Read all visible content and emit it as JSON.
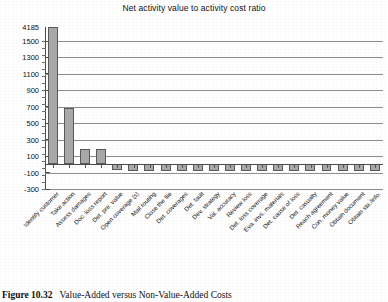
{
  "chart_data": {
    "type": "bar",
    "title": "Net activity value to activity cost ratio",
    "xlabel": "",
    "ylabel": "",
    "ylim": [
      -300,
      4185
    ],
    "grid": true,
    "legend": "none",
    "ytick_labels": [
      "4185",
      "1500",
      "1300",
      "1100",
      "900",
      "700",
      "500",
      "300",
      "100",
      "-100",
      "-300"
    ],
    "ytick_values": [
      4185,
      1500,
      1300,
      1100,
      900,
      700,
      500,
      300,
      100,
      -100,
      -300
    ],
    "categories": [
      "Identify customer",
      "Take action",
      "Assess damages",
      "Doc. loss report",
      "Det. pre. value",
      "Open coverage (s)",
      "Mail routing",
      "Close the file",
      "Det. coverages",
      "Det. fault",
      "Dev. strategy",
      "Val. accuracy",
      "Review loss",
      "Det. loss coverage",
      "Eva. invs. materials",
      "Det. cause of loss",
      "Det. casualty",
      "Reach agreement",
      "Con. money value",
      "Obtain document",
      "Obtain sta./info."
    ],
    "values": [
      4185,
      680,
      190,
      190,
      -75,
      -80,
      -80,
      -80,
      -80,
      -80,
      -80,
      -80,
      -80,
      -80,
      -80,
      -80,
      -80,
      -80,
      -80,
      -80,
      -80
    ]
  },
  "caption": {
    "figure_number": "Figure 10.32",
    "text": "Value-Added versus Non-Value-Added Costs"
  }
}
